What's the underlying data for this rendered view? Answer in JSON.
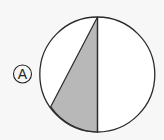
{
  "figure": {
    "label": "A",
    "colors": {
      "background": "#f7f7f7",
      "stroke": "#2a2a2a",
      "shaded_fill": "#b8b8b8",
      "circle_fill": "#ffffff"
    },
    "circle": {
      "cx": 97.3,
      "cy": 74.5,
      "r": 57.5
    },
    "shaded_region": {
      "description": "triangle from top of circle, down the vertical diameter to the bottom, with a vertex on the lower-left arc",
      "vertices": [
        [
          97.5,
          17
        ],
        [
          97.5,
          132
        ],
        [
          50.7,
          106.7
        ]
      ]
    }
  }
}
